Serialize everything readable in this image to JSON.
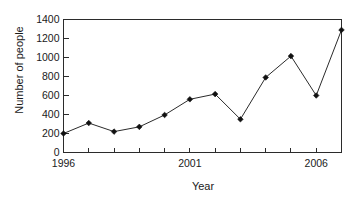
{
  "chart_data": {
    "type": "line",
    "title": "",
    "xlabel": "Year",
    "ylabel": "Number of people",
    "x": [
      1996,
      1997,
      1998,
      1999,
      2000,
      2001,
      2002,
      2003,
      2004,
      2005,
      2006,
      2007
    ],
    "values": [
      200,
      310,
      220,
      270,
      395,
      560,
      615,
      350,
      790,
      1015,
      600,
      1290
    ],
    "series": [
      {
        "name": "Number of people",
        "values": [
          200,
          310,
          220,
          270,
          395,
          560,
          615,
          350,
          790,
          1015,
          600,
          1290
        ]
      }
    ],
    "xlim": [
      1996,
      2007
    ],
    "ylim": [
      0,
      1400
    ],
    "y_ticks": [
      0,
      200,
      400,
      600,
      800,
      1000,
      1200,
      1400
    ],
    "y_tick_labels": [
      "0",
      "200",
      "400",
      "600",
      "800",
      "1000",
      "1200",
      "1400"
    ],
    "x_ticks": [
      1996,
      1997,
      1998,
      1999,
      2000,
      2001,
      2002,
      2003,
      2004,
      2005,
      2006,
      2007
    ],
    "x_tick_labels": [
      "1996",
      "",
      "",
      "",
      "",
      "2001",
      "",
      "",
      "",
      "",
      "2006",
      ""
    ],
    "x_labeled_ticks": [
      {
        "value": 1996,
        "label": "1996"
      },
      {
        "value": 2001,
        "label": "2001"
      },
      {
        "value": 2006,
        "label": "2006"
      }
    ],
    "grid": false,
    "legend": false,
    "marker": "diamond",
    "line_color": "#2b2b2b",
    "marker_color": "#111111",
    "background_color": "#ffffff",
    "axis_color": "#2b2b2b"
  }
}
